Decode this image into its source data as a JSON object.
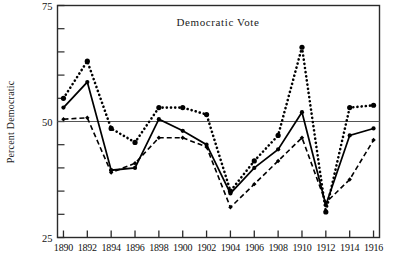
{
  "chart_data": {
    "type": "line",
    "title": "Democratic Vote",
    "xlabel": "",
    "ylabel": "Percent Democratic",
    "ylim": [
      25,
      75
    ],
    "xlim": [
      1889.5,
      1916.5
    ],
    "grid": false,
    "legend": "none",
    "y_major_ticks": [
      25,
      50,
      75
    ],
    "y_minor_ticks": [
      30,
      35,
      40,
      45,
      55,
      60,
      65,
      70
    ],
    "y_tick_labels": [
      "25",
      "50",
      "75"
    ],
    "reference_lines": [
      50
    ],
    "x_tick_labels": [
      "1890",
      "1892",
      "1894",
      "1896",
      "1898",
      "1900",
      "1902",
      "1904",
      "1906",
      "1908",
      "1910",
      "1912",
      "1914",
      "1916"
    ],
    "x_tick_values": [
      1890,
      1892,
      1894,
      1896,
      1898,
      1900,
      1902,
      1904,
      1906,
      1908,
      1910,
      1912,
      1914,
      1916
    ],
    "x": [
      1890,
      1891,
      1892,
      1893,
      1894,
      1895,
      1896,
      1897,
      1898,
      1899,
      1900,
      1901,
      1902,
      1903,
      1904,
      1905,
      1906,
      1907,
      1908,
      1909,
      1910,
      1911,
      1912,
      1913,
      1914,
      1915,
      1916
    ],
    "series": [
      {
        "name": "dotted-series",
        "style": "dotted",
        "marker": "circle",
        "x": [
          1890,
          1892,
          1894,
          1896,
          1898,
          1900,
          1902,
          1904,
          1906,
          1908,
          1910,
          1912,
          1914,
          1916
        ],
        "values": [
          55.0,
          63.0,
          48.5,
          45.5,
          53.0,
          53.0,
          51.5,
          35.0,
          41.5,
          47.0,
          66.0,
          30.5,
          53.0,
          53.5
        ]
      },
      {
        "name": "solid-series",
        "style": "solid",
        "marker": "circle",
        "x": [
          1890,
          1892,
          1894,
          1896,
          1898,
          1900,
          1902,
          1904,
          1906,
          1908,
          1910,
          1912,
          1914,
          1916
        ],
        "values": [
          53.0,
          58.5,
          39.5,
          40.0,
          50.5,
          48.0,
          45.0,
          34.5,
          40.0,
          44.0,
          52.0,
          32.0,
          47.0,
          48.5
        ]
      },
      {
        "name": "dashed-series",
        "style": "dashed",
        "marker": "diamond",
        "x": [
          1890,
          1892,
          1894,
          1896,
          1898,
          1900,
          1902,
          1904,
          1906,
          1908,
          1910,
          1912,
          1914,
          1916
        ],
        "values": [
          50.5,
          50.8,
          39.0,
          41.0,
          46.5,
          46.5,
          44.5,
          31.5,
          36.5,
          41.5,
          46.5,
          32.5,
          37.5,
          46.0
        ]
      }
    ]
  },
  "colors": {
    "ink": "#000000",
    "frame": "#2a2a2a",
    "reference": "#555555",
    "background": "#ffffff"
  }
}
